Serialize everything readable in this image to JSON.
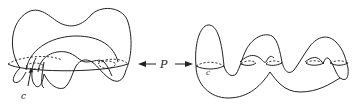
{
  "figure": {
    "left_surface": {
      "curve_label": "c"
    },
    "map": {
      "label": "P",
      "left_arrow": "←",
      "right_arrow": "→"
    },
    "right_surface": {
      "curve_label": "c"
    }
  }
}
